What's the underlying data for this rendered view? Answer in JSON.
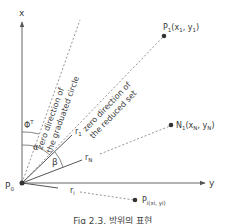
{
  "diagram": {
    "axes": {
      "x_label": "x",
      "y_label": "y",
      "origin_label": "P",
      "origin_sub": "0"
    },
    "directions": {
      "graduated_circle": "zero direction of the graduated circle",
      "graduated_line1": "zero direction of",
      "graduated_line2": "the graduated circle",
      "reduced_set_line1": "zero direction of",
      "reduced_set_line2": "the reduced set"
    },
    "angles": {
      "phi": "Φ",
      "phi_sup": "T",
      "alpha": "α",
      "beta": "β"
    },
    "rays": {
      "r1": "r",
      "r1_sub": "1",
      "rN": "r",
      "rN_sub": "N",
      "ri": "r",
      "ri_sub": "i"
    },
    "points": [
      {
        "name": "P",
        "sub": "1",
        "coords": "(x",
        "xsub": "1",
        "sep": ", y",
        "ysub": "1",
        "close": ")"
      },
      {
        "name": "N",
        "sub": "1",
        "coords": "(x",
        "xsub": "N",
        "sep": ", y",
        "ysub": "N",
        "close": ")"
      },
      {
        "name": "P",
        "sub": "i(x",
        "xsub": "i",
        "sep": ", y",
        "ysub": "i",
        "close": ")"
      }
    ],
    "caption": "Fig 2.3. 방위의 표현",
    "colors": {
      "line": "#555555",
      "text": "#3a3a3a",
      "point": "#333333"
    }
  }
}
